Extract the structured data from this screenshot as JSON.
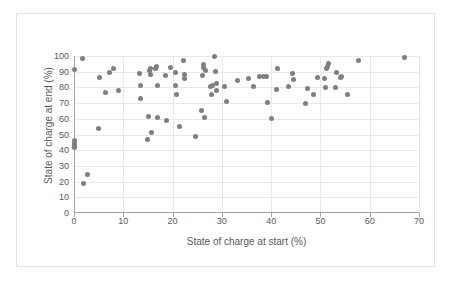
{
  "chart_data": {
    "type": "scatter",
    "title": "",
    "xlabel": "State of charge at start (%)",
    "ylabel": "State of charge at end (%)",
    "xlim": [
      0,
      70
    ],
    "ylim": [
      0,
      100
    ],
    "xticks": [
      0,
      10,
      20,
      30,
      40,
      50,
      60,
      70
    ],
    "yticks": [
      0,
      10,
      20,
      30,
      40,
      50,
      60,
      70,
      80,
      90,
      100
    ],
    "grid": "horizontal-and-vertical",
    "legend": "none",
    "marker_color": "#7f7f7f",
    "series": [
      {
        "name": "State of charge",
        "points": [
          [
            0.0,
            91.5
          ],
          [
            0.0,
            46.0
          ],
          [
            0.0,
            44.5
          ],
          [
            0.0,
            43.0
          ],
          [
            0.0,
            42.0
          ],
          [
            1.8,
            98.3
          ],
          [
            1.9,
            18.6
          ],
          [
            2.7,
            24.7
          ],
          [
            5.0,
            54.0
          ],
          [
            5.2,
            86.3
          ],
          [
            6.4,
            76.8
          ],
          [
            7.2,
            89.8
          ],
          [
            8.0,
            91.9
          ],
          [
            9.1,
            78.3
          ],
          [
            13.3,
            88.9
          ],
          [
            13.4,
            80.9
          ],
          [
            13.5,
            72.9
          ],
          [
            15.0,
            47.0
          ],
          [
            15.2,
            61.5
          ],
          [
            15.4,
            90.5
          ],
          [
            15.5,
            88.0
          ],
          [
            15.6,
            92.3
          ],
          [
            15.8,
            51.0
          ],
          [
            16.6,
            91.9
          ],
          [
            16.8,
            93.0
          ],
          [
            16.9,
            60.6
          ],
          [
            17.0,
            80.9
          ],
          [
            18.5,
            87.5
          ],
          [
            18.7,
            58.9
          ],
          [
            19.5,
            92.7
          ],
          [
            20.5,
            89.6
          ],
          [
            20.6,
            81.5
          ],
          [
            20.7,
            75.6
          ],
          [
            21.5,
            54.8
          ],
          [
            22.3,
            97.3
          ],
          [
            22.4,
            88.2
          ],
          [
            22.5,
            85.9
          ],
          [
            24.6,
            48.7
          ],
          [
            25.8,
            65.0
          ],
          [
            26.0,
            87.6
          ],
          [
            26.2,
            94.6
          ],
          [
            26.3,
            92.7
          ],
          [
            26.5,
            61.0
          ],
          [
            26.6,
            91.0
          ],
          [
            27.7,
            80.8
          ],
          [
            27.9,
            75.6
          ],
          [
            28.0,
            81.5
          ],
          [
            28.6,
            99.5
          ],
          [
            28.8,
            90.0
          ],
          [
            28.9,
            82.3
          ],
          [
            29.0,
            78.3
          ],
          [
            30.5,
            80.7
          ],
          [
            31.0,
            70.8
          ],
          [
            33.2,
            84.3
          ],
          [
            35.5,
            85.9
          ],
          [
            36.5,
            80.6
          ],
          [
            37.7,
            86.8
          ],
          [
            38.5,
            86.8
          ],
          [
            39.0,
            87.0
          ],
          [
            39.3,
            70.5
          ],
          [
            40.0,
            60.4
          ],
          [
            41.0,
            78.4
          ],
          [
            41.2,
            92.2
          ],
          [
            43.5,
            80.3
          ],
          [
            44.3,
            88.8
          ],
          [
            44.5,
            85.3
          ],
          [
            47.0,
            69.6
          ],
          [
            47.3,
            79.0
          ],
          [
            48.5,
            75.3
          ],
          [
            49.5,
            86.3
          ],
          [
            50.8,
            85.9
          ],
          [
            51.0,
            80.0
          ],
          [
            51.2,
            91.8
          ],
          [
            51.4,
            93.0
          ],
          [
            51.6,
            95.2
          ],
          [
            53.0,
            80.0
          ],
          [
            53.2,
            89.8
          ],
          [
            54.0,
            86.3
          ],
          [
            54.2,
            86.9
          ],
          [
            55.5,
            75.7
          ],
          [
            57.8,
            97.3
          ],
          [
            67.0,
            99.3
          ]
        ]
      }
    ]
  }
}
